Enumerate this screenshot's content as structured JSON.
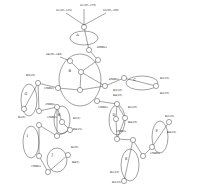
{
  "diagram": {
    "groups": [
      {
        "id": "A",
        "label": "A",
        "cx": 84,
        "cy": 38,
        "rx": 14,
        "ry": 7
      },
      {
        "id": "B",
        "label": "B",
        "cx": 80,
        "cy": 80,
        "rx": 21,
        "ry": 26
      },
      {
        "id": "C",
        "label": "C",
        "cx": 142,
        "cy": 83,
        "rx": 16,
        "ry": 7
      },
      {
        "id": "D",
        "label": "G",
        "cx": 29,
        "cy": 100,
        "rx": 8,
        "ry": 16
      },
      {
        "id": "E",
        "label": "H",
        "cx": 62,
        "cy": 120,
        "rx": 8,
        "ry": 14
      },
      {
        "id": "F",
        "label": "D",
        "cx": 117,
        "cy": 120,
        "rx": 8,
        "ry": 15
      },
      {
        "id": "G",
        "label": "F",
        "cx": 160,
        "cy": 137,
        "rx": 8,
        "ry": 16
      },
      {
        "id": "H",
        "label": "I",
        "cx": 31,
        "cy": 142,
        "rx": 8,
        "ry": 16
      },
      {
        "id": "I",
        "label": "J",
        "cx": 57,
        "cy": 160,
        "rx": 10,
        "ry": 12
      },
      {
        "id": "J",
        "label": "E",
        "cx": 130,
        "cy": 165,
        "rx": 9,
        "ry": 16
      }
    ],
    "annotations": [
      {
        "text": "S1(20~170)",
        "x": 80,
        "y": 6
      },
      {
        "text": "S1(20~135)",
        "x": 56,
        "y": 11
      },
      {
        "text": "S3(30~100)",
        "x": 103,
        "y": 11
      },
      {
        "text": "S4(30~140)",
        "x": 46,
        "y": 55
      },
      {
        "text": "40Mb/s",
        "x": 97,
        "y": 48
      },
      {
        "text": "45Mb/s",
        "x": 109,
        "y": 80
      },
      {
        "text": "15Mb/s",
        "x": 44,
        "y": 89
      },
      {
        "text": "15Mb/s",
        "x": 98,
        "y": 108
      },
      {
        "text": "R1(10)",
        "x": 160,
        "y": 79
      },
      {
        "text": "R2(10)",
        "x": 160,
        "y": 94
      },
      {
        "text": "R3(10)",
        "x": 113,
        "y": 91
      },
      {
        "text": "R4(10)",
        "x": 113,
        "y": 96
      },
      {
        "text": "R5(20)",
        "x": 26,
        "y": 76
      },
      {
        "text": "R1(0)",
        "x": 18,
        "y": 118
      },
      {
        "text": "25Mb/s",
        "x": 45,
        "y": 105
      },
      {
        "text": "15Mb/s",
        "x": 47,
        "y": 118
      },
      {
        "text": "R1(5)",
        "x": 73,
        "y": 119
      },
      {
        "text": "R4(15)",
        "x": 73,
        "y": 130
      },
      {
        "text": "R1(20)",
        "x": 128,
        "y": 108
      },
      {
        "text": "R4(20)",
        "x": 128,
        "y": 123
      },
      {
        "text": "15Mb/s",
        "x": 116,
        "y": 132
      },
      {
        "text": "R2(10)",
        "x": 165,
        "y": 117
      },
      {
        "text": "R4(20)",
        "x": 167,
        "y": 133
      },
      {
        "text": "15Mb/s",
        "x": 150,
        "y": 154
      },
      {
        "text": "R1(10)",
        "x": 110,
        "y": 173
      },
      {
        "text": "R2(20)",
        "x": 112,
        "y": 183
      },
      {
        "text": "R1(0)",
        "x": 71,
        "y": 148
      },
      {
        "text": "R4(5)",
        "x": 72,
        "y": 163
      },
      {
        "text": "15Mb/s",
        "x": 31,
        "y": 167
      }
    ],
    "nodes": [
      {
        "id": "n1",
        "x": 84,
        "y": 27
      },
      {
        "id": "n2",
        "x": 89,
        "y": 50
      },
      {
        "id": "n3",
        "x": 98,
        "y": 60
      },
      {
        "id": "n4",
        "x": 70,
        "y": 61
      },
      {
        "id": "n5",
        "x": 81,
        "y": 72
      },
      {
        "id": "n6",
        "x": 58,
        "y": 88
      },
      {
        "id": "n7",
        "x": 80,
        "y": 90
      },
      {
        "id": "n8",
        "x": 105,
        "y": 86
      },
      {
        "id": "n9",
        "x": 97,
        "y": 101
      },
      {
        "id": "n10",
        "x": 124,
        "y": 78
      },
      {
        "id": "n11",
        "x": 156,
        "y": 86
      },
      {
        "id": "n12",
        "x": 38,
        "y": 83
      },
      {
        "id": "n13",
        "x": 24,
        "y": 109
      },
      {
        "id": "n14",
        "x": 39,
        "y": 111
      },
      {
        "id": "n15",
        "x": 57,
        "y": 107
      },
      {
        "id": "n16",
        "x": 62,
        "y": 122
      },
      {
        "id": "n17",
        "x": 70,
        "y": 130
      },
      {
        "id": "n18",
        "x": 57,
        "y": 136
      },
      {
        "id": "n19",
        "x": 117,
        "y": 104
      },
      {
        "id": "n20",
        "x": 116,
        "y": 119
      },
      {
        "id": "n21",
        "x": 125,
        "y": 118
      },
      {
        "id": "n22",
        "x": 117,
        "y": 139
      },
      {
        "id": "n23",
        "x": 133,
        "y": 140
      },
      {
        "id": "n24",
        "x": 169,
        "y": 122
      },
      {
        "id": "n25",
        "x": 152,
        "y": 147
      },
      {
        "id": "n26",
        "x": 143,
        "y": 156
      },
      {
        "id": "n27",
        "x": 124,
        "y": 181
      },
      {
        "id": "n28",
        "x": 39,
        "y": 125
      },
      {
        "id": "n29",
        "x": 39,
        "y": 156
      },
      {
        "id": "n30",
        "x": 68,
        "y": 155
      },
      {
        "id": "n31",
        "x": 48,
        "y": 172
      }
    ],
    "edges": [
      [
        "n1",
        "n2"
      ],
      [
        "n2",
        "n3"
      ],
      [
        "n3",
        "n5"
      ],
      [
        "n4",
        "n5"
      ],
      [
        "n5",
        "n8"
      ],
      [
        "n6",
        "n7"
      ],
      [
        "n7",
        "n8"
      ],
      [
        "n7",
        "n5"
      ],
      [
        "n8",
        "n10"
      ],
      [
        "n10",
        "n11"
      ],
      [
        "n9",
        "n19"
      ],
      [
        "n6",
        "n12"
      ],
      [
        "n12",
        "n13"
      ],
      [
        "n12",
        "n14"
      ],
      [
        "n14",
        "n15"
      ],
      [
        "n15",
        "n16"
      ],
      [
        "n15",
        "n18"
      ],
      [
        "n16",
        "n17"
      ],
      [
        "n18",
        "n17"
      ],
      [
        "n19",
        "n20"
      ],
      [
        "n19",
        "n21"
      ],
      [
        "n20",
        "n22"
      ],
      [
        "n21",
        "n22"
      ],
      [
        "n22",
        "n23"
      ],
      [
        "n23",
        "n27"
      ],
      [
        "n24",
        "n25"
      ],
      [
        "n25",
        "n26"
      ],
      [
        "n26",
        "n23"
      ],
      [
        "n28",
        "n29"
      ],
      [
        "n29",
        "n31"
      ],
      [
        "n30",
        "n31"
      ],
      [
        "n18",
        "n28"
      ]
    ]
  }
}
